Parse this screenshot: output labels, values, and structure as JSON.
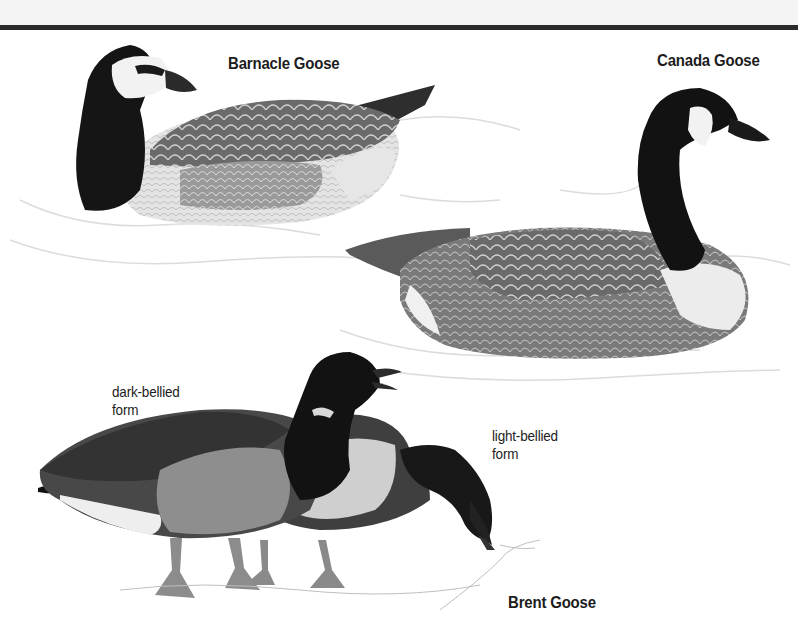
{
  "illustration": {
    "title_band_color": "#f4f4f4",
    "rule_color": "#2a2a2a",
    "species": [
      {
        "name": "Barnacle Goose",
        "pose": "swimming"
      },
      {
        "name": "Canada Goose",
        "pose": "swimming"
      },
      {
        "name": "Brent Goose",
        "pose": "standing",
        "forms": [
          {
            "line1": "dark-bellied",
            "line2": "form"
          },
          {
            "line1": "light-bellied",
            "line2": "form"
          }
        ]
      }
    ]
  }
}
